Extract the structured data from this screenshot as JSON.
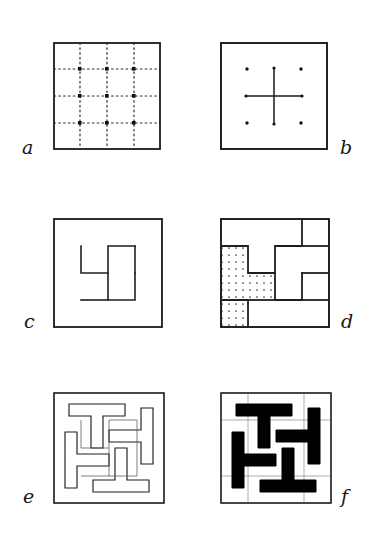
{
  "figure": {
    "panel_count": 6,
    "columns": 2,
    "rows": 3,
    "background_color": "#ffffff",
    "ink_color": "#1a1a1a",
    "fill_color": "#000000",
    "style": "hand-drawn pen-and-ink line diagram"
  },
  "panels": [
    {
      "id": "a",
      "label": "a",
      "label_side": "left",
      "caption": "dotted construction grid",
      "frame": {
        "x": 53,
        "y": 42,
        "w": 108,
        "h": 108
      },
      "grid": {
        "divisions": 4,
        "line_style": "dotted",
        "node_count": 9,
        "fractions": [
          0.25,
          0.5,
          0.75
        ],
        "overhang": 7
      },
      "shows_frame": true,
      "shows_dots": true,
      "shows_skeleton": false,
      "shows_bands": false,
      "filled": false
    },
    {
      "id": "b",
      "label": "b",
      "label_side": "right",
      "caption": "central cross laid over eight grid points",
      "frame": {
        "x": 220,
        "y": 42,
        "w": 108,
        "h": 108
      },
      "grid": {
        "divisions": 4,
        "line_style": "points-only",
        "node_count": 9,
        "fractions": [
          0.25,
          0.5,
          0.75
        ],
        "overhang": 0
      },
      "cross": {
        "arm_fraction": 0.25,
        "stroke": 1.4
      },
      "shows_frame": true,
      "shows_dots": true,
      "shows_cross": true,
      "shows_skeleton": false,
      "shows_bands": false,
      "filled": false
    },
    {
      "id": "c",
      "label": "c",
      "label_side": "left",
      "caption": "pinwheel skeleton drawn as a single meander line",
      "frame": {
        "x": 53,
        "y": 218,
        "w": 110,
        "h": 110
      },
      "skeleton": {
        "stroke": 1.5,
        "turns": 4,
        "handedness": "left-facing"
      },
      "shows_frame": true,
      "shows_dots": false,
      "shows_skeleton": true,
      "shows_bands": false,
      "filled": false
    },
    {
      "id": "d",
      "label": "d",
      "label_side": "right",
      "caption": "interlocking regions blocked out, one quadrant stippled",
      "frame": {
        "x": 220,
        "y": 218,
        "w": 110,
        "h": 110
      },
      "skeleton": {
        "stroke": 1.6,
        "turns": 4,
        "handedness": "left-facing"
      },
      "stipple": {
        "quadrant": "lower-left",
        "pattern": "dotted",
        "dot_spacing": 7
      },
      "shows_frame": true,
      "shows_dots": false,
      "shows_skeleton": true,
      "shows_regions": true,
      "shows_bands": false,
      "filled": false
    },
    {
      "id": "e",
      "label": "e",
      "label_side": "left",
      "caption": "arms thickened into outlined bands",
      "frame": {
        "x": 53,
        "y": 392,
        "w": 112,
        "h": 112
      },
      "bands": {
        "width_fraction": 0.145,
        "stroke": 1.1,
        "fill": "none"
      },
      "shows_frame": true,
      "shows_dots": false,
      "shows_skeleton": true,
      "shows_bands": true,
      "filled": false
    },
    {
      "id": "f",
      "label": "f",
      "label_side": "right",
      "caption": "finished motif with bands filled solid",
      "frame": {
        "x": 220,
        "y": 392,
        "w": 112,
        "h": 112
      },
      "bands": {
        "width_fraction": 0.145,
        "stroke": 1.1,
        "fill": "#000000"
      },
      "shows_frame": true,
      "shows_dots": false,
      "shows_skeleton": false,
      "shows_bands": true,
      "filled": true
    }
  ],
  "labels": {
    "a": "a",
    "b": "b",
    "c": "c",
    "d": "d",
    "e": "e",
    "f": "f"
  },
  "label_positions": {
    "a": {
      "x": 22,
      "y": 138
    },
    "b": {
      "x": 340,
      "y": 138
    },
    "c": {
      "x": 24,
      "y": 312
    },
    "d": {
      "x": 341,
      "y": 312
    },
    "e": {
      "x": 23,
      "y": 487
    },
    "f": {
      "x": 341,
      "y": 487
    }
  }
}
